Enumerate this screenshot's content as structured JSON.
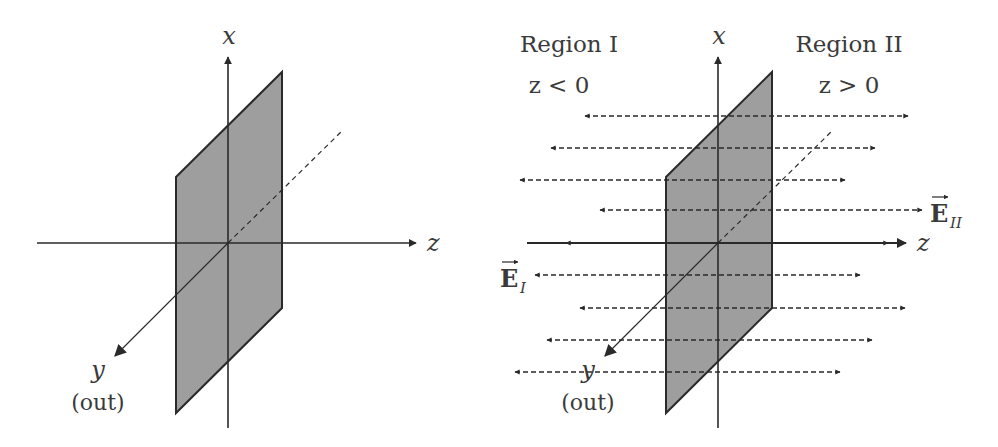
{
  "colors": {
    "line": "#2a2a2a",
    "plane_fill": "#9e9e9e",
    "text": "#3a3a3a",
    "background": "#ffffff"
  },
  "left_diagram": {
    "axes": {
      "x_label": "x",
      "y_label": "y",
      "y_note": "(out)",
      "z_label": "z"
    }
  },
  "right_diagram": {
    "axes": {
      "x_label": "x",
      "y_label": "y",
      "y_note": "(out)",
      "z_label": "z"
    },
    "regions": [
      {
        "name": "Region I",
        "condition": "z < 0"
      },
      {
        "name": "Region II",
        "condition": "z > 0"
      }
    ],
    "field_labels": {
      "E_I": {
        "base": "E",
        "sub": "I"
      },
      "E_II": {
        "base": "E",
        "sub": "II"
      }
    },
    "field_line_count": 9
  }
}
